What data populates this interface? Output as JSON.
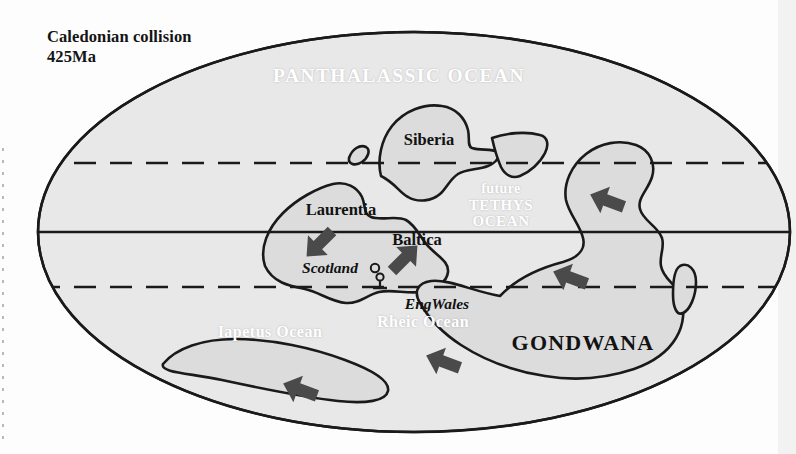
{
  "figure": {
    "kind": "paleogeographic-map",
    "projection": "ellipse-mollweide",
    "title": "Caledonian collision\n425Ma",
    "title_lines": [
      "Caledonian collision",
      "425Ma"
    ]
  },
  "colors": {
    "ocean_fill": "#e8e8e8",
    "land_fill": "#dcdcdc",
    "coastline": "#1a1a1a",
    "graticule": "#1a1a1a",
    "ocean_label": "#ffffff",
    "land_label": "#121212",
    "arrow_fill": "#4a4a4a",
    "page_background": "#fdfdfd"
  },
  "graticule": {
    "equator": {
      "name": "equator",
      "style": "solid",
      "y": 232
    },
    "tropics": [
      {
        "name": "northern-tropic",
        "style": "dashed",
        "y": 163
      },
      {
        "name": "southern-tropic",
        "style": "dashed",
        "y": 287
      }
    ]
  },
  "ocean_labels": [
    {
      "id": "panthalassic",
      "text": "PANTHALASSIC OCEAN",
      "x": 399,
      "y": 76,
      "size": 19.5,
      "variant": "caps"
    },
    {
      "id": "future-tethys-1",
      "text": "future",
      "x": 501,
      "y": 189,
      "size": 14,
      "variant": "lower"
    },
    {
      "id": "future-tethys-2",
      "text": "TETHYS",
      "x": 501,
      "y": 204,
      "size": 15,
      "variant": "caps"
    },
    {
      "id": "future-tethys-3",
      "text": "OCEAN",
      "x": 501,
      "y": 219,
      "size": 15,
      "variant": "caps"
    },
    {
      "id": "iapetus",
      "text": "Iapetus Ocean",
      "x": 270,
      "y": 332,
      "size": 16,
      "variant": "mixed"
    },
    {
      "id": "rheic",
      "text": "Rheic Ocean",
      "x": 423,
      "y": 322,
      "size": 16,
      "variant": "mixed"
    }
  ],
  "land_labels": [
    {
      "id": "siberia",
      "text": "Siberia",
      "x": 429,
      "y": 140,
      "size": 16.5,
      "style": "bold"
    },
    {
      "id": "laurentia",
      "text": "Laurentia",
      "x": 341,
      "y": 210,
      "size": 16.5,
      "style": "bold"
    },
    {
      "id": "baltica",
      "text": "Baltica",
      "x": 417,
      "y": 240,
      "size": 16.5,
      "style": "bold"
    },
    {
      "id": "gondwana",
      "text": "GONDWANA",
      "x": 583,
      "y": 343,
      "size": 22,
      "style": "bold-caps"
    },
    {
      "id": "scotland",
      "text": "Scotland",
      "x": 330,
      "y": 268,
      "size": 15.5,
      "style": "bold-italic"
    },
    {
      "id": "engwales",
      "text": "EngWales",
      "x": 437,
      "y": 304,
      "size": 15.5,
      "style": "bold-italic"
    }
  ],
  "arrows": [
    {
      "id": "arrow-laurentia",
      "x": 320,
      "y": 243,
      "rotation": 135,
      "meaning": "laurentia-convergence"
    },
    {
      "id": "arrow-baltica",
      "x": 404,
      "y": 259,
      "rotation": -45,
      "meaning": "baltica-convergence"
    },
    {
      "id": "arrow-gondwana-north",
      "x": 608,
      "y": 201,
      "rotation": -45,
      "meaning": "gondwana-convergence"
    },
    {
      "id": "arrow-gondwana-west",
      "x": 571,
      "y": 278,
      "rotation": -45,
      "meaning": "gondwana-convergence"
    },
    {
      "id": "arrow-rheic-south",
      "x": 444,
      "y": 362,
      "rotation": -45,
      "meaning": "rheic-closure"
    },
    {
      "id": "arrow-iapetus-south",
      "x": 301,
      "y": 390,
      "rotation": -45,
      "meaning": "iapetus-closure"
    }
  ],
  "markers": [
    {
      "id": "marker-circle",
      "shape": "small-circle",
      "x": 375,
      "y": 270
    },
    {
      "id": "marker-lollipop",
      "shape": "circle-on-stem",
      "x": 380,
      "y": 279
    }
  ],
  "landmasses": [
    {
      "id": "siberia",
      "label": "Siberia"
    },
    {
      "id": "laurentia",
      "label": "Laurentia"
    },
    {
      "id": "baltica",
      "label": "Baltica"
    },
    {
      "id": "gondwana",
      "label": "GONDWANA"
    },
    {
      "id": "micro-continent-tethys",
      "label": ""
    },
    {
      "id": "island-north-laurentia",
      "label": ""
    },
    {
      "id": "island-east-gondwana",
      "label": ""
    },
    {
      "id": "southern-terrane-strip",
      "label": ""
    }
  ]
}
